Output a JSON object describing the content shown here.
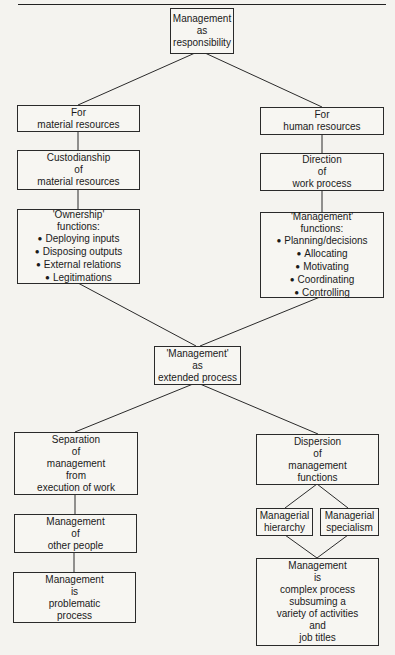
{
  "diagram": {
    "root": [
      "Management",
      "as",
      "responsibility"
    ],
    "left_branch": {
      "for": [
        "For",
        "material resources"
      ],
      "custodianship": [
        "Custodianship",
        "of",
        "material resources"
      ],
      "functions_title": [
        "'Ownership'",
        "functions:"
      ],
      "functions": [
        "Deploying inputs",
        "Disposing outputs",
        "External relations",
        "Legitimations"
      ]
    },
    "right_branch": {
      "for": [
        "For",
        "human resources"
      ],
      "direction": [
        "Direction",
        "of",
        "work process"
      ],
      "functions_title": [
        "'Management'",
        "functions:"
      ],
      "functions": [
        "Planning/decisions",
        "Allocating",
        "Motivating",
        "Coordinating",
        "Controlling"
      ]
    },
    "center": [
      "'Management'",
      "as",
      "extended process"
    ],
    "lower_left": {
      "separation": [
        "Separation",
        "of",
        "management",
        "from",
        "execution of work"
      ],
      "other_people": [
        "Management",
        "of",
        "other people"
      ],
      "problematic": [
        "Management",
        "is",
        "problematic",
        "process"
      ]
    },
    "lower_right": {
      "dispersion": [
        "Dispersion",
        "of",
        "management",
        "functions"
      ],
      "hierarchy": [
        "Managerial",
        "hierarchy"
      ],
      "specialism": [
        "Managerial",
        "specialism"
      ],
      "complex": [
        "Management",
        "is",
        "complex process",
        "subsuming a",
        "variety of activities",
        "and",
        "job titles"
      ]
    }
  }
}
